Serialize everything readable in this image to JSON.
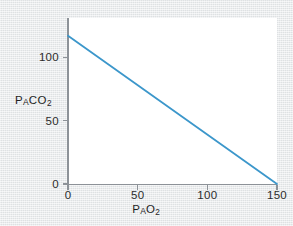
{
  "figure": {
    "background_color": "#e3e6e8",
    "panel_color": "#ffffff",
    "axis_color": "#8d9298"
  },
  "axis_titles": {
    "y": {
      "lead": "P",
      "sub": "A",
      "mid": "CO",
      "digit": "2",
      "full": "PACO2"
    },
    "x": {
      "lead": "P",
      "sub": "A",
      "mid": "O",
      "digit": "2",
      "full": "PAO2"
    }
  },
  "ticks": {
    "y": [
      {
        "label": "0",
        "value": 0
      },
      {
        "label": "50",
        "value": 50
      },
      {
        "label": "100",
        "value": 100
      }
    ],
    "x": [
      {
        "label": "0",
        "value": 0
      },
      {
        "label": "50",
        "value": 50
      },
      {
        "label": "100",
        "value": 100
      },
      {
        "label": "150",
        "value": 150
      }
    ]
  },
  "chart_data": {
    "type": "line",
    "title": "",
    "subtitle": "",
    "xlabel": "PAO2",
    "ylabel": "PACO2",
    "xlim": [
      0,
      150
    ],
    "ylim": [
      0,
      131
    ],
    "xticks": [
      0,
      50,
      100,
      150
    ],
    "yticks": [
      0,
      50,
      100
    ],
    "grid": false,
    "legend": null,
    "annotations": [],
    "series": [
      {
        "name": "Alveolar gas line",
        "color": "#3c97cb",
        "line_width": 1.8,
        "x": [
          0,
          150
        ],
        "y": [
          117,
          0
        ],
        "points": [
          {
            "x": 0,
            "y": 117
          },
          {
            "x": 50,
            "y": 78
          },
          {
            "x": 100,
            "y": 39
          },
          {
            "x": 150,
            "y": 0
          }
        ]
      }
    ]
  }
}
